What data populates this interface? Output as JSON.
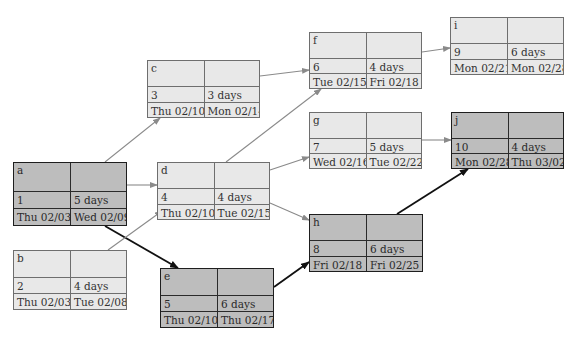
{
  "diagram": {
    "type": "project-network-precedence-diagram",
    "colors": {
      "normal_fill": "#e8e8e8",
      "critical_fill": "#bdbdbd",
      "normal_edge": "#8a8a8a",
      "critical_edge": "#111111"
    },
    "nodes": [
      {
        "id": "a",
        "num": "1",
        "duration": "5 days",
        "start": "Thu 02/03",
        "finish": "Wed 02/09",
        "critical": true,
        "x": 13,
        "y": 162,
        "w": 114,
        "h": 64
      },
      {
        "id": "b",
        "num": "2",
        "duration": "4 days",
        "start": "Thu 02/03",
        "finish": "Tue 02/08",
        "critical": false,
        "x": 13,
        "y": 250,
        "w": 114,
        "h": 60
      },
      {
        "id": "c",
        "num": "3",
        "duration": "3 days",
        "start": "Thu 02/10",
        "finish": "Mon 02/14",
        "critical": false,
        "x": 147,
        "y": 60,
        "w": 113,
        "h": 58
      },
      {
        "id": "d",
        "num": "4",
        "duration": "4 days",
        "start": "Thu 02/10",
        "finish": "Tue 02/15",
        "critical": false,
        "x": 157,
        "y": 162,
        "w": 113,
        "h": 58
      },
      {
        "id": "e",
        "num": "5",
        "duration": "6 days",
        "start": "Thu 02/10",
        "finish": "Thu 02/17",
        "critical": true,
        "x": 160,
        "y": 268,
        "w": 114,
        "h": 60
      },
      {
        "id": "f",
        "num": "6",
        "duration": "4 days",
        "start": "Tue 02/15",
        "finish": "Fri 02/18",
        "critical": false,
        "x": 309,
        "y": 32,
        "w": 113,
        "h": 57
      },
      {
        "id": "g",
        "num": "7",
        "duration": "5 days",
        "start": "Wed 02/16",
        "finish": "Tue 02/22",
        "critical": false,
        "x": 309,
        "y": 112,
        "w": 113,
        "h": 57
      },
      {
        "id": "h",
        "num": "8",
        "duration": "6 days",
        "start": "Fri 02/18",
        "finish": "Fri 02/25",
        "critical": true,
        "x": 309,
        "y": 214,
        "w": 114,
        "h": 58
      },
      {
        "id": "i",
        "num": "9",
        "duration": "6 days",
        "start": "Mon 02/21",
        "finish": "Mon 02/28",
        "critical": false,
        "x": 450,
        "y": 17,
        "w": 114,
        "h": 58
      },
      {
        "id": "j",
        "num": "10",
        "duration": "4 days",
        "start": "Mon 02/28",
        "finish": "Thu 03/02",
        "critical": true,
        "x": 451,
        "y": 112,
        "w": 113,
        "h": 57
      }
    ],
    "edges": [
      {
        "from": "a",
        "to": "c",
        "critical": false,
        "x1": 105,
        "y1": 162,
        "x2": 160,
        "y2": 118
      },
      {
        "from": "a",
        "to": "d",
        "critical": false,
        "x1": 127,
        "y1": 185,
        "x2": 157,
        "y2": 185
      },
      {
        "from": "a",
        "to": "e",
        "critical": true,
        "x1": 105,
        "y1": 226,
        "x2": 178,
        "y2": 268
      },
      {
        "from": "b",
        "to": "d",
        "critical": false,
        "x1": 108,
        "y1": 250,
        "x2": 162,
        "y2": 211
      },
      {
        "from": "c",
        "to": "f",
        "critical": false,
        "x1": 260,
        "y1": 76,
        "x2": 309,
        "y2": 70
      },
      {
        "from": "d",
        "to": "f",
        "critical": false,
        "x1": 226,
        "y1": 162,
        "x2": 321,
        "y2": 89
      },
      {
        "from": "d",
        "to": "g",
        "critical": false,
        "x1": 270,
        "y1": 170,
        "x2": 309,
        "y2": 157
      },
      {
        "from": "d",
        "to": "h",
        "critical": false,
        "x1": 270,
        "y1": 203,
        "x2": 309,
        "y2": 220
      },
      {
        "from": "e",
        "to": "h",
        "critical": true,
        "x1": 274,
        "y1": 287,
        "x2": 309,
        "y2": 262
      },
      {
        "from": "f",
        "to": "i",
        "critical": false,
        "x1": 422,
        "y1": 52,
        "x2": 450,
        "y2": 48
      },
      {
        "from": "g",
        "to": "j",
        "critical": false,
        "x1": 422,
        "y1": 140,
        "x2": 451,
        "y2": 140
      },
      {
        "from": "h",
        "to": "j",
        "critical": true,
        "x1": 397,
        "y1": 214,
        "x2": 468,
        "y2": 169
      }
    ]
  }
}
